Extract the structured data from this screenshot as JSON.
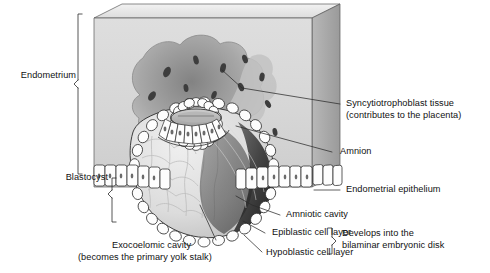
{
  "figure": {
    "type": "anatomical-diagram",
    "background_color": "#ffffff",
    "ink_color": "#111111",
    "palette": {
      "slab_front": "#d9d9d9",
      "slab_top": "#e9e9e9",
      "slab_side": "#a8a8a8",
      "lacuna_dark": "#8c8c8c",
      "lacuna_mid": "#b4b4b4",
      "cavity_light": "#e4e4e4",
      "exocoelom_shade": "#cfcfcf",
      "amniotic_dark": "#3a3a3a",
      "cell_fill": "#fdfdfd",
      "outline": "#2b2b2b"
    }
  },
  "labels": {
    "endometrium": "Endometrium",
    "blastocyst": "Blastocyst",
    "syncytiotrophoblast_line1": "Syncytiotrophoblast tissue",
    "syncytiotrophoblast_line2": "(contributes to the placenta)",
    "amnion": "Amnion",
    "endometrial_epithelium": "Endometrial epithelium",
    "amniotic_cavity": "Amniotic cavity",
    "epiblastic_cell_layer": "Epiblastic cell layer",
    "hypoblastic_cell_layer": "Hypoblastic cell layer",
    "develops_line1": "Develops into the",
    "develops_line2": "bilaminar embryonic disk",
    "exocoelomic_line1": "Exocoelomic cavity",
    "exocoelomic_line2": "(becomes the primary yolk stalk)"
  },
  "brackets": [
    {
      "name": "endometrium-bracket",
      "orientation": "left",
      "spans": "top of slab to endometrial epithelium"
    },
    {
      "name": "blastocyst-bracket",
      "orientation": "left",
      "spans": "epithelium line down past exocoelomic cavity"
    },
    {
      "name": "bilaminar-disk-bracket",
      "orientation": "right",
      "spans": "epiblastic and hypoblastic cell layer labels"
    }
  ],
  "leader_lines": [
    {
      "name": "syncytiotrophoblast-leader",
      "to": "lacunae in trophoblast"
    },
    {
      "name": "amnion-leader",
      "to": "amnion roof over embryonic disk"
    },
    {
      "name": "endometrial-epithelium-leader",
      "to": "columnar epithelium row"
    },
    {
      "name": "amniotic-cavity-leader",
      "to": "cavity above epiblast"
    },
    {
      "name": "epiblastic-leader",
      "to": "epiblast cell layer"
    },
    {
      "name": "hypoblastic-leader",
      "to": "hypoblast cell layer"
    },
    {
      "name": "exocoelomic-leader",
      "to": "exocoelomic cavity interior"
    }
  ]
}
